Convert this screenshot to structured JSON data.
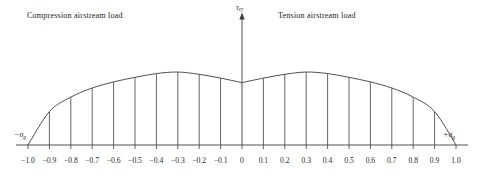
{
  "figure": {
    "title_left": "Compression airstream load",
    "title_right": "Tension airstream load",
    "y_axis_symbol": "τ",
    "y_axis_subscript": "cy",
    "x_axis_left_symbol": "−σ",
    "x_axis_left_subscript": "g",
    "x_axis_right_symbol": "+σ",
    "x_axis_right_subscript": "g",
    "line_color": "#3c3c3c",
    "text_color": "#231f20",
    "background": "#ffffff"
  },
  "chart_data": {
    "type": "area",
    "title": "",
    "subtitle": "",
    "xlabel": "σg",
    "ylabel": "τcy",
    "xlim": [
      -1.0,
      1.0
    ],
    "ylim": [
      0,
      1.0
    ],
    "grid": false,
    "legend": null,
    "annotations": [
      {
        "text": "Compression airstream load",
        "x": -0.62,
        "y": 0.95
      },
      {
        "text": "Tension airstream load",
        "x": 0.42,
        "y": 0.95
      },
      {
        "text": "τcy",
        "x": 0.0,
        "y": 1.05
      },
      {
        "text": "−σg",
        "x": -1.05,
        "y": 0.1
      },
      {
        "text": "+σg",
        "x": 1.05,
        "y": 0.1
      }
    ],
    "tick_labels": [
      "−1.0",
      "−0.9",
      "−0.8",
      "−0.7",
      "−0.6",
      "−0.5",
      "−0.4",
      "−0.3",
      "−0.2",
      "−0.1",
      "0",
      "0.1",
      "0.2",
      "0.3",
      "0.4",
      "0.5",
      "0.6",
      "0.7",
      "0.8",
      "0.9",
      "1.0"
    ],
    "x": [
      -1.0,
      -0.9,
      -0.8,
      -0.7,
      -0.6,
      -0.5,
      -0.4,
      -0.3,
      -0.2,
      -0.1,
      0.0,
      0.1,
      0.2,
      0.3,
      0.4,
      0.5,
      0.6,
      0.7,
      0.8,
      0.9,
      1.0
    ],
    "values": [
      0.0,
      0.44,
      0.63,
      0.75,
      0.83,
      0.89,
      0.94,
      0.96,
      0.93,
      0.88,
      0.82,
      0.88,
      0.93,
      0.96,
      0.94,
      0.89,
      0.83,
      0.75,
      0.63,
      0.44,
      0.0
    ],
    "hatch_x": [
      -0.9,
      -0.8,
      -0.7,
      -0.6,
      -0.5,
      -0.4,
      -0.3,
      -0.2,
      -0.1,
      0.1,
      0.2,
      0.3,
      0.4,
      0.5,
      0.6,
      0.7,
      0.8,
      0.9
    ],
    "series": [
      {
        "name": "Cyclic shear stress envelope",
        "values": [
          0.0,
          0.44,
          0.63,
          0.75,
          0.83,
          0.89,
          0.94,
          0.96,
          0.93,
          0.88,
          0.82,
          0.88,
          0.93,
          0.96,
          0.94,
          0.89,
          0.83,
          0.75,
          0.63,
          0.44,
          0.0
        ]
      }
    ]
  }
}
